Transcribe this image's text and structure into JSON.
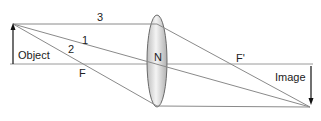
{
  "labels": {
    "object": "Object",
    "image": "Image",
    "focal_front": "F",
    "focal_back": "F'",
    "optical_center": "N",
    "ray1": "1",
    "ray2": "2",
    "ray3": "3"
  },
  "colors": {
    "ray": "#8a8a8a",
    "axis": "#9a9a9a",
    "arrow": "#111111",
    "lens_fill_light": "#f2f2f2",
    "lens_fill_dark": "#b8b8b8",
    "lens_stroke": "#6a6a6a"
  }
}
